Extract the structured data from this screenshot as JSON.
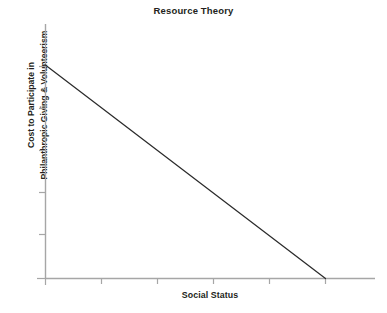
{
  "chart_data": {
    "type": "line",
    "title": "Resource Theory",
    "xlabel": "Social Status",
    "ylabel_line1": "Cost to Participate in",
    "ylabel_line2": "Philanthropic Giving & Volunteerism",
    "ylabel": "Cost to Participate in Philanthropic Giving & Volunteerism",
    "grid": false,
    "legend": false,
    "legend_position": "none",
    "tick_labels_x": [],
    "tick_labels_y": [],
    "xlim": [
      0,
      100
    ],
    "ylim": [
      0,
      100
    ],
    "x_tick_count": 6,
    "y_tick_count": 6,
    "series": [
      {
        "name": "Cost vs Social Status",
        "color": "#2b2b2b",
        "x": [
          0,
          10,
          20,
          30,
          40,
          50,
          60,
          70,
          80,
          85
        ],
        "values": [
          84,
          74,
          65,
          55,
          45,
          36,
          26,
          16,
          7,
          0
        ],
        "description": "Straight descending line: cost to participate falls linearly as social status rises, reaching zero before the right edge of the axis."
      }
    ],
    "annotations": []
  },
  "axes": {
    "axis_color": "#a6a6a6",
    "tick_color": "#a6a6a6",
    "line_color": "#2b2b2b",
    "background": "#ffffff"
  },
  "caption": {
    "remnant_text": ""
  }
}
